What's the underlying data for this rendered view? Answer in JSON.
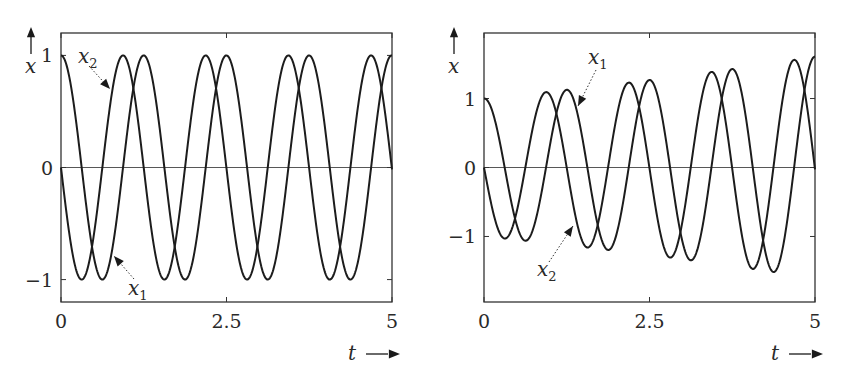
{
  "chart_data": [
    {
      "type": "line",
      "title": "",
      "xlabel": "t",
      "ylabel": "x",
      "xlim": [
        0,
        5
      ],
      "ylim": [
        -1.2,
        1.2
      ],
      "xticks": [
        0,
        2.5,
        5
      ],
      "xtick_labels": [
        "0",
        "2.5",
        "5"
      ],
      "yticks": [
        -1,
        0,
        1
      ],
      "ytick_labels": [
        "−1",
        "0",
        "1"
      ],
      "grid": false,
      "zero_line": true,
      "model": {
        "omega": 5.03,
        "growth": 0.0
      },
      "series": [
        {
          "name": "x1",
          "label": "x",
          "sub": "1",
          "form": "cos",
          "x": [
            0,
            0.3125,
            0.625,
            0.9375,
            1.25,
            1.875,
            2.5,
            3.125,
            3.75,
            4.375,
            5
          ],
          "values": [
            1,
            0,
            -1,
            0,
            1,
            -1,
            1,
            -1,
            1,
            -1,
            1
          ]
        },
        {
          "name": "x2",
          "label": "x",
          "sub": "2",
          "form": "-sin",
          "x": [
            0,
            0.3125,
            0.625,
            0.9375,
            1.25,
            1.5625,
            2.1875,
            2.8125,
            3.4375,
            4.0625,
            4.6875,
            5
          ],
          "values": [
            0,
            -1,
            0,
            1,
            0,
            -1,
            1,
            -1,
            1,
            -1,
            1,
            0
          ]
        }
      ],
      "annotations": [
        {
          "text": "x2",
          "points_to": "x2 rising near t=0.73"
        },
        {
          "text": "x1",
          "points_to": "x1 rising near t=0.75"
        }
      ]
    },
    {
      "type": "line",
      "title": "",
      "xlabel": "t",
      "ylabel": "x",
      "xlim": [
        0,
        5
      ],
      "ylim": [
        -1.95,
        1.95
      ],
      "xticks": [
        0,
        2.5,
        5
      ],
      "xtick_labels": [
        "0",
        "2.5",
        "5"
      ],
      "yticks": [
        -1,
        0,
        1
      ],
      "ytick_labels": [
        "−1",
        "0",
        "1"
      ],
      "grid": false,
      "zero_line": true,
      "model": {
        "omega": 5.03,
        "growth": 0.095
      },
      "series": [
        {
          "name": "x1",
          "label": "x",
          "sub": "1",
          "form": "e^(at)cos",
          "x": [
            0,
            0.625,
            1.25,
            1.875,
            2.5,
            3.125,
            3.75,
            4.375,
            5
          ],
          "values": [
            1.0,
            -1.06,
            1.13,
            -1.2,
            1.27,
            -1.35,
            1.43,
            -1.52,
            1.61
          ]
        },
        {
          "name": "x2",
          "label": "x",
          "sub": "2",
          "form": "-e^(at)sin",
          "x": [
            0,
            0.3125,
            0.9375,
            1.5625,
            2.1875,
            2.8125,
            3.4375,
            4.0625,
            4.6875,
            5
          ],
          "values": [
            0,
            -1.03,
            1.09,
            -1.16,
            1.23,
            -1.31,
            1.39,
            -1.47,
            1.56,
            0
          ]
        }
      ],
      "annotations": [
        {
          "text": "x1",
          "points_to": "x1 descending near t=1.4"
        },
        {
          "text": "x2",
          "points_to": "x2 rising near t=1.36"
        }
      ]
    }
  ],
  "panels": [
    {
      "frame": {
        "left": 61,
        "top": 33,
        "right": 392,
        "bottom": 302
      },
      "y_axis": {
        "arrow": "up",
        "label": "x"
      },
      "x_axis": {
        "arrow": "right",
        "label": "t"
      },
      "labels": [
        {
          "base": "x",
          "sub": "2",
          "x": 78,
          "y": 63
        },
        {
          "base": "x",
          "sub": "1",
          "x": 128,
          "y": 295
        }
      ]
    },
    {
      "frame": {
        "left": 484,
        "top": 33,
        "right": 815,
        "bottom": 302
      },
      "y_axis": {
        "arrow": "up",
        "label": "x"
      },
      "x_axis": {
        "arrow": "right",
        "label": "t"
      },
      "labels": [
        {
          "base": "x",
          "sub": "1",
          "x": 588,
          "y": 64
        },
        {
          "base": "x",
          "sub": "2",
          "x": 537,
          "y": 276
        }
      ]
    }
  ]
}
